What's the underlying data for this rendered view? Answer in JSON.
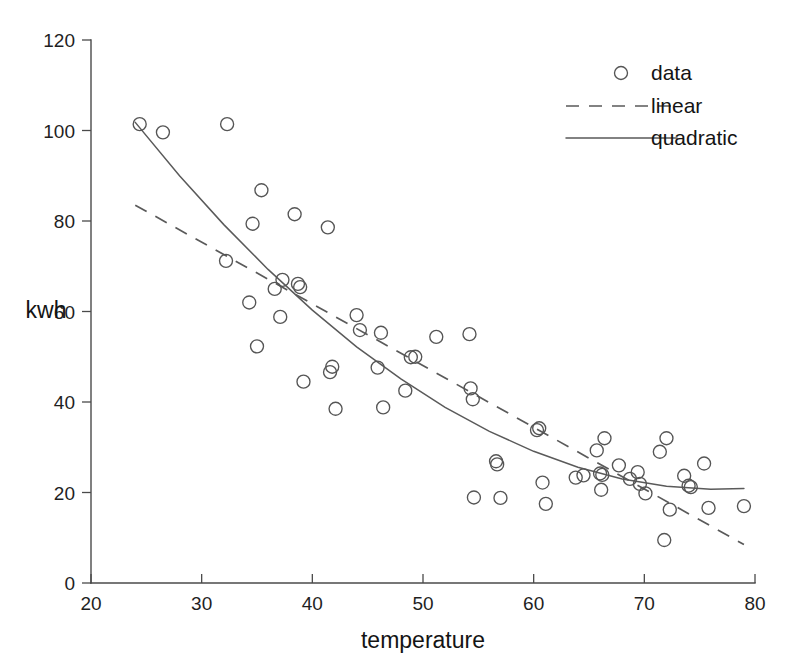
{
  "chart_data": {
    "type": "scatter",
    "title": "",
    "xlabel": "temperature",
    "ylabel": "kwh",
    "xlim": [
      20,
      80
    ],
    "ylim": [
      0,
      120
    ],
    "xticks": [
      20,
      30,
      40,
      50,
      60,
      70,
      80
    ],
    "yticks": [
      0,
      20,
      40,
      60,
      80,
      100,
      120
    ],
    "xticklabels": [
      "20",
      "30",
      "40",
      "50",
      "60",
      "70",
      "80"
    ],
    "yticklabels": [
      "0",
      "20",
      "40",
      "60",
      "80",
      "100",
      "120"
    ],
    "grid": false,
    "legend_position": "upper right",
    "marker": "open-circle",
    "series": [
      {
        "name": "data",
        "type": "scatter",
        "points": [
          [
            24.4,
            101.4
          ],
          [
            26.5,
            99.6
          ],
          [
            32.3,
            101.4
          ],
          [
            32.2,
            71.2
          ],
          [
            34.6,
            79.4
          ],
          [
            34.3,
            62.0
          ],
          [
            35.4,
            86.8
          ],
          [
            35.0,
            52.3
          ],
          [
            36.6,
            65.0
          ],
          [
            37.3,
            67.0
          ],
          [
            37.1,
            58.8
          ],
          [
            38.4,
            81.5
          ],
          [
            38.7,
            66.1
          ],
          [
            38.9,
            65.4
          ],
          [
            39.2,
            44.5
          ],
          [
            41.4,
            78.6
          ],
          [
            41.8,
            47.8
          ],
          [
            41.6,
            46.6
          ],
          [
            42.1,
            38.5
          ],
          [
            44.0,
            59.2
          ],
          [
            44.3,
            55.9
          ],
          [
            45.9,
            47.6
          ],
          [
            46.2,
            55.3
          ],
          [
            46.4,
            38.8
          ],
          [
            48.4,
            42.5
          ],
          [
            48.9,
            49.9
          ],
          [
            49.3,
            50.0
          ],
          [
            51.2,
            54.4
          ],
          [
            54.2,
            55.0
          ],
          [
            54.3,
            43.0
          ],
          [
            54.5,
            40.6
          ],
          [
            54.6,
            18.9
          ],
          [
            56.6,
            26.9
          ],
          [
            56.7,
            26.2
          ],
          [
            57.0,
            18.8
          ],
          [
            60.3,
            33.8
          ],
          [
            60.5,
            34.2
          ],
          [
            60.8,
            22.2
          ],
          [
            61.1,
            17.5
          ],
          [
            63.8,
            23.3
          ],
          [
            64.5,
            23.8
          ],
          [
            65.7,
            29.3
          ],
          [
            66.0,
            24.2
          ],
          [
            66.2,
            23.9
          ],
          [
            66.1,
            20.6
          ],
          [
            66.4,
            32.0
          ],
          [
            67.7,
            26.0
          ],
          [
            68.7,
            23.0
          ],
          [
            69.4,
            24.5
          ],
          [
            69.6,
            21.9
          ],
          [
            70.1,
            19.8
          ],
          [
            71.4,
            29.0
          ],
          [
            71.8,
            9.5
          ],
          [
            72.0,
            32.0
          ],
          [
            72.3,
            16.2
          ],
          [
            73.6,
            23.7
          ],
          [
            74.0,
            21.5
          ],
          [
            74.2,
            21.2
          ],
          [
            75.4,
            26.4
          ],
          [
            75.8,
            16.6
          ],
          [
            79.0,
            17.0
          ]
        ]
      },
      {
        "name": "linear",
        "type": "line",
        "style": "dashed",
        "endpoints": [
          [
            24.0,
            83.5
          ],
          [
            79.0,
            8.5
          ]
        ]
      },
      {
        "name": "quadratic",
        "type": "line",
        "style": "solid",
        "sample_points": [
          [
            24.0,
            101.8
          ],
          [
            28.0,
            90.0
          ],
          [
            32.0,
            79.2
          ],
          [
            36.0,
            69.3
          ],
          [
            40.0,
            60.3
          ],
          [
            44.0,
            52.2
          ],
          [
            48.0,
            45.1
          ],
          [
            52.0,
            38.8
          ],
          [
            56.0,
            33.5
          ],
          [
            60.0,
            29.1
          ],
          [
            64.0,
            25.6
          ],
          [
            68.0,
            23.0
          ],
          [
            72.0,
            21.4
          ],
          [
            76.0,
            20.7
          ],
          [
            79.0,
            20.9
          ]
        ]
      }
    ],
    "legend": [
      {
        "label": "data",
        "key": "open-circle"
      },
      {
        "label": "linear",
        "key": "dashed-line"
      },
      {
        "label": "quadratic",
        "key": "solid-line"
      }
    ]
  },
  "colors": {
    "background": "#ffffff",
    "axis": "#4a4a4a",
    "marker": "#555555",
    "fit": "#5a5a5a",
    "text": "#141414"
  }
}
